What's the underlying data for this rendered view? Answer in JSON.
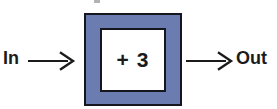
{
  "diagram": {
    "type": "function-machine",
    "input": {
      "label": "In",
      "arrow_icon": "arrow-right-icon"
    },
    "machine": {
      "rule": "+ 3",
      "operation": "add",
      "operand": 3,
      "outer_fill_color": "#6A7CB0",
      "outer_stroke_color": "#16161E",
      "inner_fill_color": "#FFFFFF",
      "inner_stroke_color": "#16161E"
    },
    "output": {
      "label": "Out",
      "arrow_icon": "arrow-right-icon"
    },
    "background_color": "#FFFFFF",
    "text_color": "#1B1B1B"
  }
}
